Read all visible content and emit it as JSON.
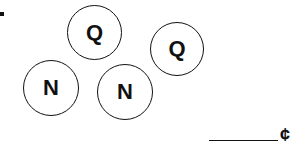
{
  "coins": [
    {
      "label": "Q",
      "type": "quarter",
      "cx": 94,
      "cy": 32,
      "r": 27
    },
    {
      "label": "Q",
      "type": "quarter",
      "cx": 177,
      "cy": 49,
      "r": 27
    },
    {
      "label": "N",
      "type": "nickel",
      "cx": 51,
      "cy": 88,
      "r": 28
    },
    {
      "label": "N",
      "type": "nickel",
      "cx": 125,
      "cy": 92,
      "r": 28
    }
  ],
  "answer": {
    "value": "",
    "unit": "¢"
  }
}
